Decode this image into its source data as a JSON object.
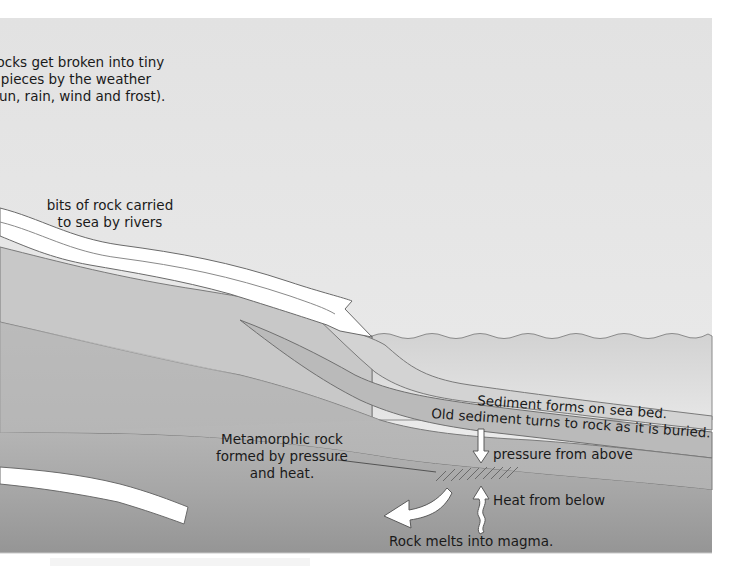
{
  "diagram": {
    "labels": {
      "weathering": [
        "Rocks get broken into tiny",
        "pieces by the weather",
        "(sun, rain, wind and frost)."
      ],
      "rivers": [
        "bits of rock carried",
        "to sea by rivers"
      ],
      "sediment_forms": "Sediment forms on sea bed.",
      "old_sediment": "Old sediment turns to rock as it is buried.",
      "pressure": "pressure from above",
      "metamorphic": [
        "Metamorphic rock",
        "formed by pressure",
        "and heat."
      ],
      "heat": "Heat from below",
      "magma": "Rock melts into magma."
    },
    "icons": {
      "river_arrow": "river-flow-arrow",
      "pressure_arrow": "down-arrow",
      "heat_arrow": "wavy-up-arrow",
      "subduction_arrow": "curved-left-arrow",
      "hatch": "metamorphic-hatching"
    },
    "colors": {
      "sky": "#e4e4e4",
      "sea": "#dcdcdc",
      "land_upper": "#c9c9c9",
      "sediment_new": "#d4d4d4",
      "sediment_old": "#bcbcbc",
      "rock_layer": "#c2c2c2",
      "deep_rock": "#a9a9a9",
      "magma_zone": "#9b9b9b",
      "outline": "#707070",
      "arrow_fill": "#ffffff",
      "text": "#1a1a1a"
    }
  }
}
